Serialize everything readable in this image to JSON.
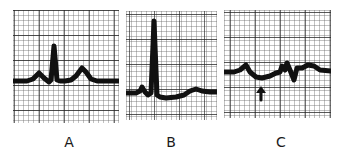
{
  "figure": {
    "panels": [
      {
        "id": "A",
        "label": "A",
        "description": "ECG strip with normal P wave, tall narrow QRS complex, upright T wave"
      },
      {
        "id": "B",
        "label": "B",
        "description": "ECG strip with very tall R wave, small P wave, flattened T wave"
      },
      {
        "id": "C",
        "label": "C",
        "description": "ECG strip with low-amplitude complexes and arrow marking a depressed segment"
      }
    ],
    "annotations": [
      {
        "panel": "C",
        "type": "arrow",
        "direction": "up",
        "icon": "arrow-up-icon"
      }
    ]
  },
  "colors": {
    "grid_minor": "#555555",
    "grid_major": "#222222",
    "trace": "#111111",
    "background": "#ffffff"
  }
}
